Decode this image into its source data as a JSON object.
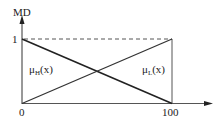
{
  "diagram": {
    "type": "fuzzy-membership-functions",
    "y_axis_label": "MD",
    "y_max_label": "1",
    "x_min_label": "0",
    "x_max_label": "100",
    "curves": [
      {
        "name": "mu_H",
        "symbol": "μ",
        "subscript": "H",
        "arg": "(x)",
        "from": {
          "x": 0,
          "y": 1
        },
        "to": {
          "x": 100,
          "y": 0
        },
        "style": "solid-thick"
      },
      {
        "name": "mu_L",
        "symbol": "μ",
        "subscript": "L",
        "arg": "(x)",
        "from": {
          "x": 0,
          "y": 0
        },
        "to": {
          "x": 100,
          "y": 1
        },
        "style": "solid-thin"
      }
    ],
    "reference_line": {
      "y": 1,
      "style": "dashed",
      "from_x": 0,
      "to_x": 100
    },
    "vertical_line": {
      "x": 100,
      "from_y": 0,
      "to_y": 1
    },
    "colors": {
      "line": "#222222",
      "thin_line": "#444444",
      "background": "#ffffff"
    }
  }
}
